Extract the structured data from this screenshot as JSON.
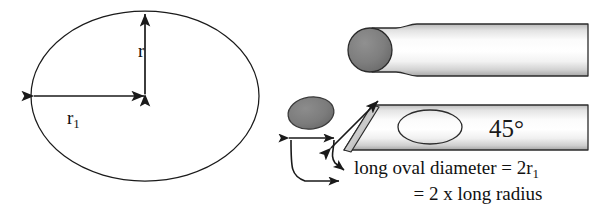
{
  "figure": {
    "labels": {
      "radius_short": "r",
      "radius_long_prefix": "r",
      "radius_long_subscript": "1",
      "angle": "45°"
    },
    "caption": {
      "line1_prefix": "long oval diameter = 2r",
      "line1_subscript": "1",
      "line2": "= 2 x long radius"
    }
  },
  "colors": {
    "stroke": "#1a1a1a",
    "tip_gray": "#808080",
    "tip_gray_dark": "#6e6e6e",
    "body_light": "#fdfdfd",
    "body_shade": "#c9c9c9",
    "background": "#ffffff"
  },
  "geometry": {
    "ellipse": {
      "center_x": 145,
      "center_y": 96,
      "radius_long": 114,
      "radius_short": 85
    },
    "arrows": {
      "short_radius_vertical": true,
      "long_radius_horizontal": true
    },
    "tools": [
      {
        "name": "round-tip-tool",
        "tip_shape": "circle",
        "top": 28,
        "bottom": 72
      },
      {
        "name": "bevel-tip-tool",
        "tip_shape": "45-degree-bevel",
        "top": 105,
        "bottom": 150
      }
    ],
    "small_oval": {
      "center_x": 311,
      "center_y": 113,
      "rx": 23,
      "ry": 16
    }
  }
}
